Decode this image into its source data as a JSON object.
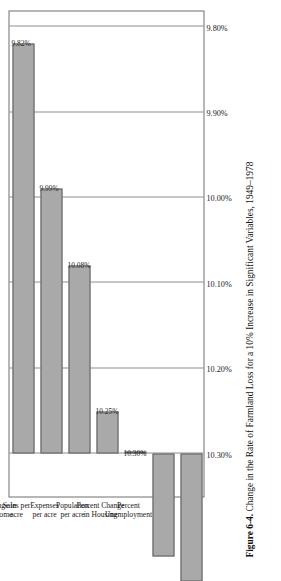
{
  "figure": {
    "number_label": "Figure 6-4.",
    "caption": "Change in the Rate of Farmland Loss for a 10% Increase in Significant Variables, 1949–1978"
  },
  "chart_data": {
    "type": "bar",
    "orientation": "horizontal",
    "title": "Change in the Rate of Farmland Loss for a 10% Increase in Significant Variables, 1949–1978",
    "xlabel": "",
    "ylabel": "",
    "categories": [
      "Harvested Cropland Acres",
      "Percent Change in Median Income",
      "Sales per acre",
      "Expenses per acre",
      "Population per acre",
      "Percent Change in Housing",
      "Percent Unemployment"
    ],
    "values": [
      9.82,
      9.99,
      10.08,
      10.25,
      10.3,
      10.42,
      10.45
    ],
    "value_labels": [
      "9.82%",
      "9.99%",
      "10.08%",
      "10.25%",
      "10.30%",
      "",
      ""
    ],
    "tick_labels": [
      "10.30%",
      "10.20%",
      "10.10%",
      "10.00%",
      "9.90%",
      "9.80%"
    ],
    "tick_values": [
      10.3,
      10.2,
      10.1,
      10.0,
      9.9,
      9.8
    ],
    "xlim": [
      10.35,
      9.78
    ],
    "axis_reversed": true,
    "grid": true,
    "legend": false,
    "bar_color": "#a9a9a9",
    "bar_edge_color": "#5c5c5c",
    "baseline_value": 10.3
  },
  "category_lines": [
    [
      "Harvested",
      "Cropland",
      "Acres"
    ],
    [
      "Percent Change in",
      "Median Income"
    ],
    [
      "Sales per",
      "acre"
    ],
    [
      "Expenses",
      "per acre"
    ],
    [
      "Population",
      "per acre"
    ],
    [
      "Percent Change",
      "in Housing"
    ],
    [
      "Percent",
      "Unemployment"
    ]
  ]
}
